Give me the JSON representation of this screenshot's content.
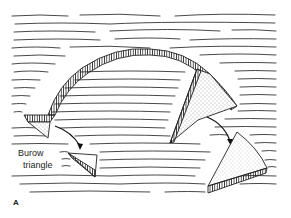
{
  "figure": {
    "panel_label": "A",
    "labels": {
      "burow_line1": "Burow",
      "burow_line2": "triangle"
    },
    "colors": {
      "ink": "#222222",
      "background": "#ffffff"
    }
  }
}
